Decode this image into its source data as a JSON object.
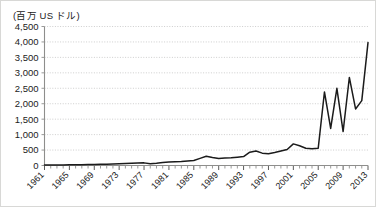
{
  "unit_label": "(百万 US ドル)",
  "colors": {
    "series": "#1b1b1b",
    "grid": "#b9b9b7",
    "axis": "#8e8e8c",
    "text": "#222222",
    "background": "#ffffff",
    "border": "#d8d8d6"
  },
  "chart_data": {
    "type": "line",
    "title": "",
    "subtitle": "",
    "xlabel": "",
    "ylabel": "(百万 US ドル)",
    "ylim": [
      0,
      4500
    ],
    "ytick_step": 500,
    "ytick_labels": [
      "0",
      "500",
      "1,000",
      "1,500",
      "2,000",
      "2,500",
      "3,000",
      "3,500",
      "4,000",
      "4,500"
    ],
    "ytick_values": [
      0,
      500,
      1000,
      1500,
      2000,
      2500,
      3000,
      3500,
      4000,
      4500
    ],
    "xlim": [
      1961,
      2013
    ],
    "xtick_labels": [
      "1961",
      "1965",
      "1969",
      "1973",
      "1977",
      "1981",
      "1985",
      "1989",
      "1993",
      "1997",
      "2001",
      "2005",
      "2009",
      "2013"
    ],
    "xtick_values": [
      1961,
      1965,
      1969,
      1973,
      1977,
      1981,
      1985,
      1989,
      1993,
      1997,
      2001,
      2005,
      2009,
      2013
    ],
    "xtick_label_rotation": -45,
    "minor_xticks_every": 1,
    "grid": true,
    "grid_axis": "y",
    "legend": false,
    "legend_position": "none",
    "series": [
      {
        "name": "value",
        "x": [
          1961,
          1962,
          1963,
          1964,
          1965,
          1966,
          1967,
          1968,
          1969,
          1970,
          1971,
          1972,
          1973,
          1974,
          1975,
          1976,
          1977,
          1978,
          1979,
          1980,
          1981,
          1982,
          1983,
          1984,
          1985,
          1986,
          1987,
          1988,
          1989,
          1990,
          1991,
          1992,
          1993,
          1994,
          1995,
          1996,
          1997,
          1998,
          1999,
          2000,
          2001,
          2002,
          2003,
          2004,
          2005,
          2006,
          2007,
          2008,
          2009,
          2010,
          2011,
          2012,
          2013
        ],
        "values": [
          15,
          16,
          18,
          20,
          22,
          25,
          28,
          30,
          33,
          38,
          42,
          48,
          55,
          62,
          70,
          78,
          85,
          60,
          75,
          95,
          110,
          120,
          130,
          145,
          160,
          230,
          300,
          260,
          225,
          240,
          250,
          270,
          290,
          430,
          470,
          400,
          380,
          420,
          470,
          520,
          700,
          640,
          560,
          540,
          560,
          2380,
          1200,
          2500,
          1100,
          2850,
          1830,
          2100,
          3980
        ]
      }
    ]
  }
}
